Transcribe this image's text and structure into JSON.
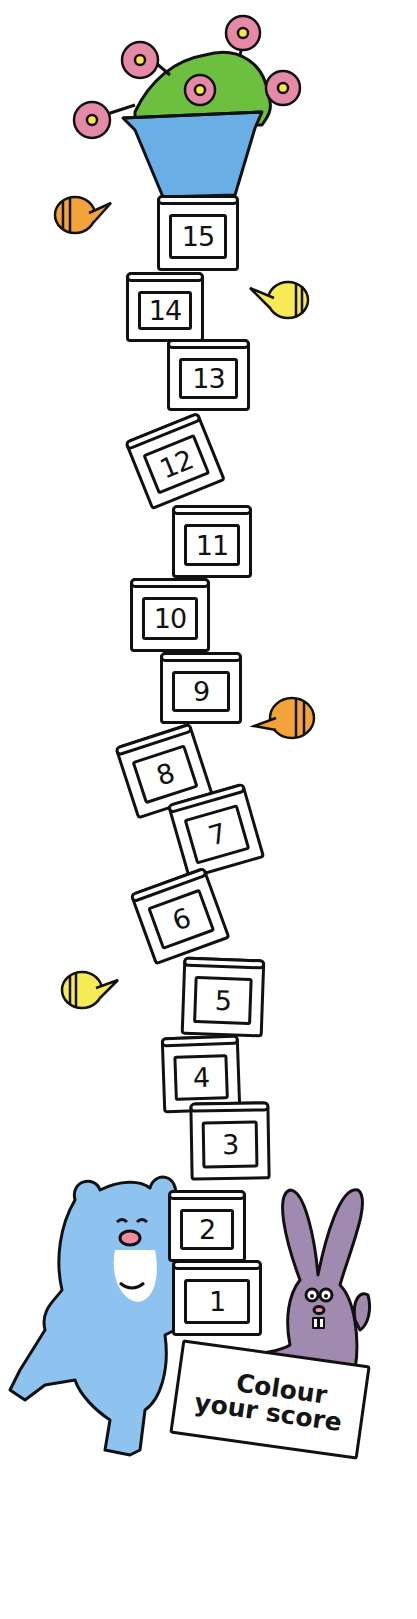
{
  "title": "Colour your score",
  "sign": {
    "line1": "Colour",
    "line2": "your score"
  },
  "boxes": [
    {
      "number": "15",
      "x": 157,
      "y": 195,
      "w": 82,
      "h": 76,
      "rot": 0
    },
    {
      "number": "14",
      "x": 126,
      "y": 272,
      "w": 78,
      "h": 70,
      "rot": 0
    },
    {
      "number": "13",
      "x": 167,
      "y": 339,
      "w": 83,
      "h": 72,
      "rot": 0
    },
    {
      "number": "12",
      "x": 135,
      "y": 424,
      "w": 80,
      "h": 74,
      "rot": -22
    },
    {
      "number": "11",
      "x": 172,
      "y": 505,
      "w": 80,
      "h": 73,
      "rot": 0
    },
    {
      "number": "10",
      "x": 130,
      "y": 578,
      "w": 80,
      "h": 74,
      "rot": 0
    },
    {
      "number": "9",
      "x": 160,
      "y": 652,
      "w": 82,
      "h": 72,
      "rot": 0
    },
    {
      "number": "8",
      "x": 124,
      "y": 733,
      "w": 80,
      "h": 76,
      "rot": -18
    },
    {
      "number": "7",
      "x": 176,
      "y": 792,
      "w": 80,
      "h": 78,
      "rot": -16
    },
    {
      "number": "6",
      "x": 140,
      "y": 878,
      "w": 80,
      "h": 76,
      "rot": -20
    },
    {
      "number": "5",
      "x": 182,
      "y": 958,
      "w": 82,
      "h": 78,
      "rot": 2
    },
    {
      "number": "4",
      "x": 162,
      "y": 1036,
      "w": 78,
      "h": 76,
      "rot": -2
    },
    {
      "number": "3",
      "x": 190,
      "y": 1102,
      "w": 80,
      "h": 78,
      "rot": -1
    },
    {
      "number": "2",
      "x": 168,
      "y": 1190,
      "w": 78,
      "h": 72,
      "rot": 0
    },
    {
      "number": "1",
      "x": 172,
      "y": 1260,
      "w": 90,
      "h": 76,
      "rot": 0
    }
  ],
  "colors": {
    "pot": "#6aaee6",
    "leaves": "#6cbf3f",
    "flower": "#e58aa6",
    "flower_center": "#f7e84a",
    "bee_orange": "#f2a43a",
    "bee_yellow": "#f6ea55",
    "bear": "#8ec2ef",
    "bear_belly": "#ffffff",
    "bear_nose": "#f08aa0",
    "rabbit": "#a08aaf",
    "rabbit_ear_inner": "#e89ab0",
    "outline": "#111111"
  },
  "icons": {
    "flower_pot": "flower-pot-icon",
    "bee": "bee-icon",
    "bear": "bear-icon",
    "rabbit": "rabbit-icon"
  }
}
